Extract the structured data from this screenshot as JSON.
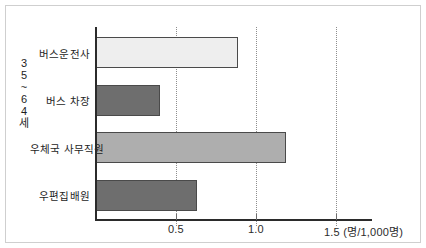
{
  "chart_data": {
    "type": "bar",
    "orientation": "horizontal",
    "title": "",
    "subtitle": "",
    "group_label": "35~64세",
    "group_label_chars": [
      "3",
      "5",
      "~",
      "6",
      "4",
      "세"
    ],
    "categories": [
      "버스운전사",
      "버스 차장",
      "우체국 사무직원",
      "우편집배원"
    ],
    "values": [
      0.89,
      0.4,
      1.19,
      0.63
    ],
    "xlabel": "",
    "ylabel": "",
    "unit": "(명/1,000명)",
    "xlim": [
      0,
      1.73
    ],
    "xticks": [
      0.5,
      1.0,
      1.5
    ],
    "xtick_labels": [
      "0.5",
      "1.0",
      "1.5"
    ],
    "grid": "vertical-dotted",
    "legend": "none",
    "series": [
      {
        "name": "35~64세",
        "values": [
          0.89,
          0.4,
          1.19,
          0.63
        ]
      }
    ],
    "bar_colors": [
      "#eeeeee",
      "#6e6e6e",
      "#aeaeae",
      "#6e6e6e"
    ],
    "bar_border_color": "#4a4a4a",
    "axis_color": "#2b2b2b",
    "gridline_color": "#8e8e8e",
    "frame_color": "#cfcfcf",
    "background_color": "#ffffff"
  }
}
